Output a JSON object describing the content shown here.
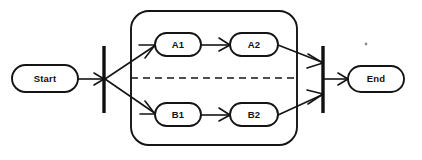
{
  "diagram": {
    "type": "uml-activity-diagram",
    "background_color": "#ffffff",
    "line_color": "#141414",
    "nodes": [
      {
        "id": "start",
        "label": "Start",
        "shape": "stadium",
        "x": 12,
        "y": 65,
        "w": 66,
        "h": 27
      },
      {
        "id": "a1",
        "label": "A1",
        "shape": "stadium",
        "x": 155,
        "y": 33,
        "w": 46,
        "h": 23
      },
      {
        "id": "a2",
        "label": "A2",
        "shape": "stadium",
        "x": 230,
        "y": 33,
        "w": 48,
        "h": 23
      },
      {
        "id": "b1",
        "label": "B1",
        "shape": "stadium",
        "x": 155,
        "y": 103,
        "w": 46,
        "h": 23
      },
      {
        "id": "b2",
        "label": "B2",
        "shape": "stadium",
        "x": 230,
        "y": 103,
        "w": 48,
        "h": 23
      },
      {
        "id": "end",
        "label": "End",
        "shape": "stadium",
        "x": 348,
        "y": 66,
        "w": 56,
        "h": 26
      }
    ],
    "bars": [
      {
        "id": "fork-bar",
        "name": "fork",
        "x": 104,
        "y1": 46,
        "y2": 113
      },
      {
        "id": "join-bar",
        "name": "join",
        "x": 323,
        "y1": 46,
        "y2": 113
      }
    ],
    "group": {
      "id": "parallel-region",
      "label": "",
      "x": 131,
      "y": 11,
      "w": 166,
      "h": 134,
      "corner_radius": 18,
      "divider": {
        "orientation": "horizontal",
        "style": "dashed",
        "y": 78,
        "x1": 131,
        "x2": 297
      }
    },
    "edges": [
      {
        "from": "start",
        "to": "fork-bar",
        "style": "solid",
        "arrow": "open"
      },
      {
        "from": "fork-bar",
        "to": "a1",
        "style": "solid",
        "arrow": "open"
      },
      {
        "from": "fork-bar",
        "to": "b1",
        "style": "solid",
        "arrow": "open"
      },
      {
        "from": "a1",
        "to": "a2",
        "style": "solid",
        "arrow": "open"
      },
      {
        "from": "b1",
        "to": "b2",
        "style": "solid",
        "arrow": "open"
      },
      {
        "from": "a2",
        "to": "join-bar",
        "style": "solid",
        "arrow": "open"
      },
      {
        "from": "b2",
        "to": "join-bar",
        "style": "solid",
        "arrow": "open"
      },
      {
        "from": "join-bar",
        "to": "end",
        "style": "solid",
        "arrow": "open"
      }
    ],
    "artifacts": [
      {
        "id": "scan-speck",
        "x": 366,
        "y": 44,
        "r": 1.4
      }
    ]
  }
}
